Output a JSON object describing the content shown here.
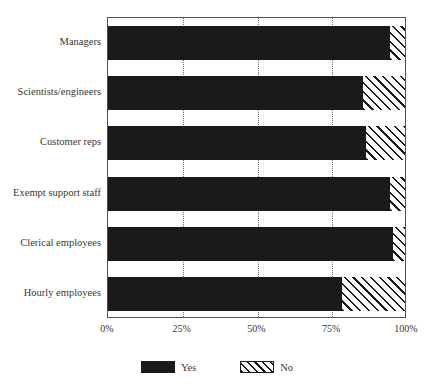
{
  "chart_data": {
    "type": "bar",
    "orientation": "horizontal",
    "stacked": true,
    "title": "",
    "xlabel": "",
    "ylabel": "",
    "xlim": [
      0,
      100
    ],
    "grid": true,
    "grid_style": "dotted vertical",
    "legend_position": "bottom-center",
    "categories": [
      "Managers",
      "Scientists/engineers",
      "Customer reps",
      "Exempt support staff",
      "Clerical employees",
      "Hourly employees"
    ],
    "series": [
      {
        "name": "Yes",
        "color": "#1a1a1a",
        "fill": "solid",
        "values": [
          94,
          85,
          86,
          94,
          95,
          78
        ]
      },
      {
        "name": "No",
        "color": "#1a1a1a",
        "fill": "diagonal-hatch",
        "values": [
          6,
          15,
          14,
          6,
          5,
          22
        ]
      }
    ],
    "xticks": [
      0,
      25,
      50,
      75,
      100
    ],
    "xticklabels": [
      "0%",
      "25%",
      "50%",
      "75%",
      "100%"
    ]
  },
  "axes": {
    "x_tick_labels": [
      "0%",
      "25%",
      "50%",
      "75%",
      "100%"
    ],
    "y_tick_labels": [
      "Managers",
      "Scientists/engineers",
      "Customer reps",
      "Exempt support staff",
      "Clerical employees",
      "Hourly employees"
    ]
  },
  "legend": {
    "entries": [
      {
        "label": "Yes",
        "swatch": "solid-black-swatch"
      },
      {
        "label": "No",
        "swatch": "hatched-swatch"
      }
    ]
  }
}
